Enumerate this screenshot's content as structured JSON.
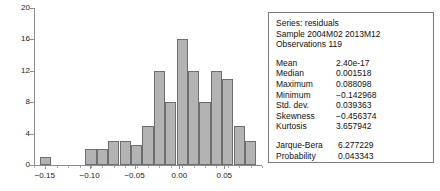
{
  "chart_data": {
    "type": "bar",
    "title": "",
    "xlabel": "",
    "ylabel": "",
    "grid": false,
    "legend": "none",
    "xlim": [
      -0.162,
      0.092
    ],
    "ylim": [
      0,
      20
    ],
    "yticks": [
      0,
      4,
      8,
      12,
      16,
      20
    ],
    "ytick_labels": [
      "0",
      "4",
      "8",
      "12",
      "16",
      "20"
    ],
    "xticks": [
      -0.15,
      -0.1,
      -0.05,
      0.0,
      0.05
    ],
    "xtick_labels": [
      "−0.15",
      "−0.10",
      "−0.05",
      "0.00",
      "0.05"
    ],
    "bin_width": 0.0127,
    "bin_centers": [
      -0.1493,
      -0.1366,
      -0.1239,
      -0.1112,
      -0.0985,
      -0.0858,
      -0.0731,
      -0.0604,
      -0.0477,
      -0.035,
      -0.0223,
      -0.0096,
      0.0031,
      0.0158,
      0.0285,
      0.0412,
      0.0539,
      0.0666,
      0.0793
    ],
    "values": [
      1,
      0,
      0,
      0,
      2,
      2,
      3,
      3,
      2.5,
      5,
      12,
      8,
      16,
      12,
      8,
      12,
      11,
      5,
      3
    ],
    "bar_fill": "#b3b3b3",
    "bar_edge": "#6e6e6e",
    "axis_color": "#8c8c8c"
  },
  "stats": {
    "header": {
      "series_line": "Series: residuals",
      "sample_line": "Sample 2004M02 2013M12",
      "observations_line": "Observations 119"
    },
    "rows": [
      {
        "label": "Mean",
        "value": "2.40e-17"
      },
      {
        "label": "Median",
        "value": "0.001518"
      },
      {
        "label": "Maximum",
        "value": "0.088098"
      },
      {
        "label": "Minimum",
        "value": "−0.142968"
      },
      {
        "label": "Std. dev.",
        "value": "0.039363"
      },
      {
        "label": "Skewness",
        "value": "−0.456374"
      },
      {
        "label": "Kurtosis",
        "value": "3.657942"
      }
    ],
    "test_rows": [
      {
        "label": "Jarque-Bera",
        "value": "6.277229"
      },
      {
        "label": "Probability",
        "value": "0.043343"
      }
    ]
  }
}
